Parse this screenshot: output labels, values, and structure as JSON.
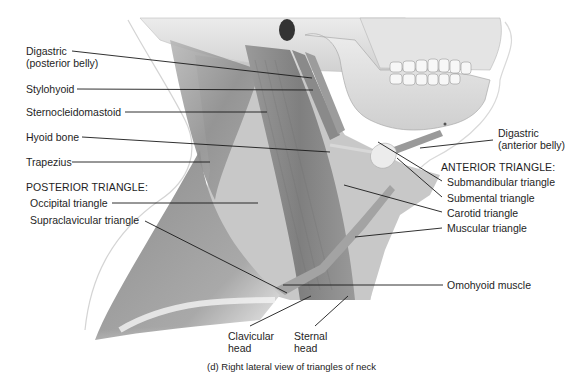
{
  "figure": {
    "caption": "(d) Right lateral view of triangles of neck",
    "colors": {
      "background": "#ffffff",
      "triangle_fill": "#c9c9c9",
      "muscle_dark": "#8a8a8a",
      "muscle_mid": "#a8a8a8",
      "bone": "#e2e2e2",
      "leader_line": "#1a1a1a"
    },
    "labels_left": {
      "digastric_posterior_line1": "Digastric",
      "digastric_posterior_line2": "(posterior belly)",
      "stylohyoid": "Stylohyoid",
      "sternocleidomastoid": "Sternocleidomastoid",
      "hyoid_bone": "Hyoid bone",
      "trapezius": "Trapezius",
      "posterior_heading": "POSTERIOR TRIANGLE:",
      "occipital_triangle": "Occipital triangle",
      "supraclavicular_triangle": "Supraclavicular triangle"
    },
    "labels_right": {
      "digastric_anterior_line1": "Digastric",
      "digastric_anterior_line2": "(anterior belly)",
      "anterior_heading": "ANTERIOR TRIANGLE:",
      "submandibular_triangle": "Submandibular triangle",
      "submental_triangle": "Submental triangle",
      "carotid_triangle": "Carotid triangle",
      "muscular_triangle": "Muscular triangle",
      "omohyoid_muscle": "Omohyoid muscle"
    },
    "labels_bottom": {
      "clavicular_line1": "Clavicular",
      "clavicular_line2": "head",
      "sternal_line1": "Sternal",
      "sternal_line2": "head"
    }
  }
}
